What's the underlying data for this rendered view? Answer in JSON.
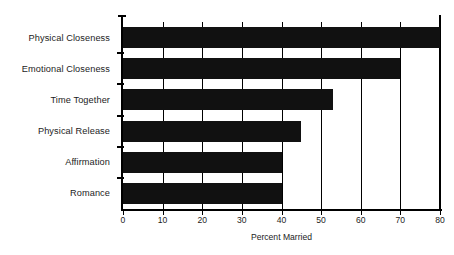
{
  "chart_data": {
    "type": "bar",
    "orientation": "horizontal",
    "title": "",
    "xlabel": "Percent Married",
    "ylabel": "",
    "xlim": [
      0,
      80
    ],
    "xticks": [
      0,
      10,
      20,
      30,
      40,
      50,
      60,
      70,
      80
    ],
    "xtick_labels": [
      "0",
      "10",
      "20",
      "30",
      "40",
      "50",
      "60",
      "70",
      "80"
    ],
    "grid": true,
    "grid_axis": "x",
    "legend": null,
    "bar_color": "#111111",
    "background_color": "#ffffff",
    "axis_color": "#000000",
    "categories": [
      "Physical Closeness",
      "Emotional Closeness",
      "Time Together",
      "Physical Release",
      "Affirmation",
      "Romance"
    ],
    "values": [
      80,
      70,
      53,
      45,
      40,
      40
    ],
    "series": [
      {
        "name": "Percent Married",
        "values": [
          80,
          70,
          53,
          45,
          40,
          40
        ]
      }
    ],
    "points": [
      {
        "category": "Physical Closeness",
        "value": 80
      },
      {
        "category": "Emotional Closeness",
        "value": 70
      },
      {
        "category": "Time Together",
        "value": 53
      },
      {
        "category": "Physical Release",
        "value": 45
      },
      {
        "category": "Affirmation",
        "value": 40
      },
      {
        "category": "Romance",
        "value": 40
      }
    ]
  }
}
